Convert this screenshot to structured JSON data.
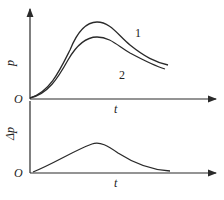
{
  "top_plot": {
    "y_label": "p",
    "x_label": "t",
    "origin_label": "O",
    "curve_labels": [
      "1",
      "2"
    ]
  },
  "bottom_plot": {
    "y_label": "Δp",
    "x_label": "t",
    "origin_label": "O"
  },
  "colors": {
    "line": "#2a2a2a",
    "background": "#ffffff"
  }
}
